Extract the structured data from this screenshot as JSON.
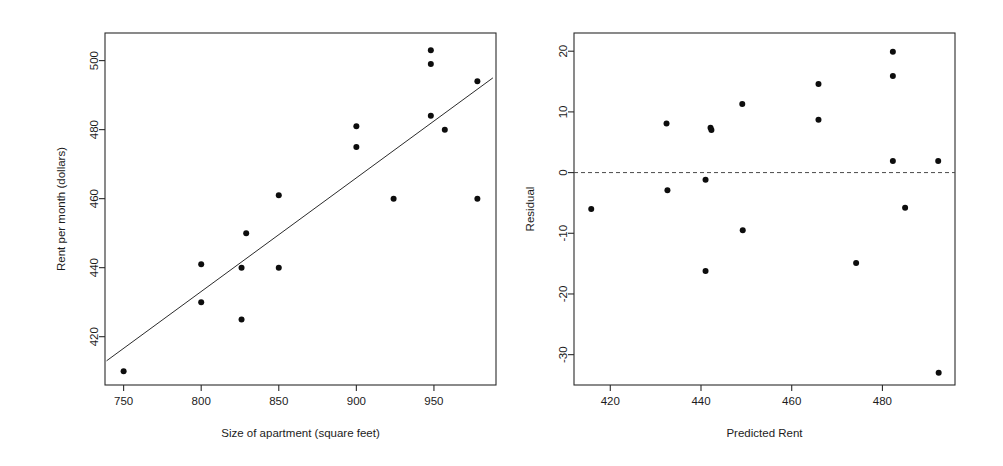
{
  "figure": {
    "background_color": "#ffffff",
    "point_color": "#0d0d0d",
    "axis_color": "#2b2b2b"
  },
  "chart_data": [
    {
      "id": "scatter-rent-vs-size",
      "type": "scatter",
      "title": "",
      "xlabel": "Size of apartment (square feet)",
      "ylabel": "Rent per month (dollars)",
      "xlim": [
        738,
        990
      ],
      "ylim": [
        406,
        508
      ],
      "xticks": [
        750,
        800,
        850,
        900,
        950
      ],
      "yticks": [
        420,
        440,
        460,
        480,
        500
      ],
      "grid": false,
      "legend": "none",
      "points": [
        {
          "x": 750,
          "y": 410
        },
        {
          "x": 800,
          "y": 441
        },
        {
          "x": 800,
          "y": 430
        },
        {
          "x": 826,
          "y": 440
        },
        {
          "x": 829,
          "y": 450
        },
        {
          "x": 826,
          "y": 425
        },
        {
          "x": 850,
          "y": 461
        },
        {
          "x": 850,
          "y": 440
        },
        {
          "x": 900,
          "y": 481
        },
        {
          "x": 900,
          "y": 475
        },
        {
          "x": 924,
          "y": 460
        },
        {
          "x": 948,
          "y": 503
        },
        {
          "x": 948,
          "y": 499
        },
        {
          "x": 948,
          "y": 484
        },
        {
          "x": 957,
          "y": 480
        },
        {
          "x": 978,
          "y": 494
        },
        {
          "x": 978,
          "y": 460
        }
      ],
      "fit_line": {
        "label": "least-squares regression line",
        "x_start": 739,
        "y_start": 413,
        "x_end": 988,
        "y_end": 495
      }
    },
    {
      "id": "scatter-residual-vs-predicted",
      "type": "scatter",
      "title": "",
      "xlabel": "Predicted Rent",
      "ylabel": "Residual",
      "xlim": [
        412,
        496
      ],
      "ylim": [
        -35,
        23
      ],
      "xticks": [
        420,
        440,
        460,
        480
      ],
      "yticks": [
        -30,
        -20,
        -10,
        0,
        10,
        20
      ],
      "grid": false,
      "legend": "none",
      "reference_line": {
        "label": "zero residual",
        "y": 0,
        "style": "dashed"
      },
      "points": [
        {
          "x": 415.8,
          "y": -6.0
        },
        {
          "x": 432.4,
          "y": 8.1
        },
        {
          "x": 432.6,
          "y": -2.9
        },
        {
          "x": 441.0,
          "y": -1.2
        },
        {
          "x": 441.0,
          "y": -16.2
        },
        {
          "x": 442.1,
          "y": 7.4
        },
        {
          "x": 442.3,
          "y": 7.0
        },
        {
          "x": 449.1,
          "y": 11.3
        },
        {
          "x": 449.2,
          "y": -9.5
        },
        {
          "x": 465.9,
          "y": 14.6
        },
        {
          "x": 465.9,
          "y": 8.7
        },
        {
          "x": 474.2,
          "y": -14.9
        },
        {
          "x": 482.3,
          "y": 19.9
        },
        {
          "x": 482.3,
          "y": 15.9
        },
        {
          "x": 482.3,
          "y": 1.9
        },
        {
          "x": 485.0,
          "y": -5.8
        },
        {
          "x": 492.3,
          "y": 1.9
        },
        {
          "x": 492.4,
          "y": -33.0
        }
      ]
    }
  ]
}
